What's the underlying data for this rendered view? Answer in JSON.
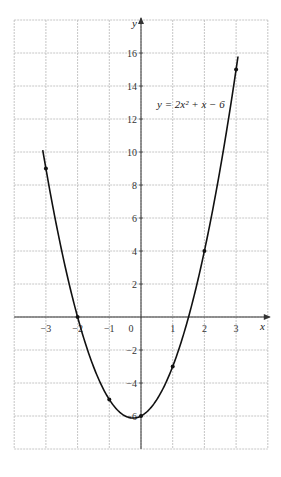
{
  "chart_data": {
    "type": "line",
    "title": "",
    "equation_label": "y = 2x² + x − 6",
    "xlabel": "x",
    "ylabel": "y",
    "xlim": [
      -4,
      4
    ],
    "ylim": [
      -8,
      18
    ],
    "grid": true,
    "x_ticks": [
      -3,
      -2,
      -1,
      0,
      1,
      2,
      3
    ],
    "y_ticks": [
      -6,
      -4,
      -2,
      2,
      4,
      6,
      8,
      10,
      12,
      14,
      16
    ],
    "series": [
      {
        "name": "y = 2x² + x − 6",
        "function": {
          "a": 2,
          "b": 1,
          "c": -6
        },
        "x_range": [
          -3.1,
          3.06
        ],
        "points": [
          {
            "x": -3,
            "y": 9
          },
          {
            "x": -2,
            "y": 0
          },
          {
            "x": -1,
            "y": -5
          },
          {
            "x": 0,
            "y": -6
          },
          {
            "x": 1,
            "y": -3
          },
          {
            "x": 2,
            "y": 4
          },
          {
            "x": 3,
            "y": 15
          }
        ]
      }
    ]
  },
  "colors": {
    "grid": "#b8b8b8",
    "axis": "#333333",
    "curve": "#111111"
  }
}
